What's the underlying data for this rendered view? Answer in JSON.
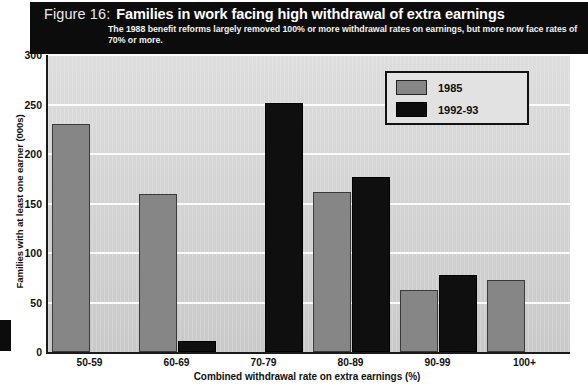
{
  "header": {
    "figure_number": "Figure 16:",
    "title": "Families in work facing high withdrawal of extra earnings",
    "subtitle": "The 1988 benefit reforms largely removed 100% or more withdrawal rates on earnings, but more now face rates of 70% or more."
  },
  "legend": {
    "position": "top-right",
    "items": [
      {
        "label": "1985",
        "color": "#868686"
      },
      {
        "label": "1992-93",
        "color": "#0d0d0d"
      }
    ]
  },
  "axes": {
    "y_ticks": [
      "300",
      "250",
      "200",
      "150",
      "100",
      "50",
      "0"
    ],
    "y_title": "Families with at least one earner (000s)",
    "x_title": "Combined withdrawal rate on extra earnings (%)"
  },
  "chart_data": {
    "type": "bar",
    "title": "Families in work facing high withdrawal of extra earnings",
    "subtitle": "The 1988 benefit reforms largely removed 100% or more withdrawal rates on earnings, but more now face rates of 70% or more.",
    "categories": [
      "50-59",
      "60-69",
      "70-79",
      "80-89",
      "90-99",
      "100+"
    ],
    "series": [
      {
        "name": "1985",
        "color": "#868686",
        "values": [
          230,
          160,
          0,
          162,
          63,
          73
        ]
      },
      {
        "name": "1992-93",
        "color": "#0d0d0d",
        "values": [
          0,
          11,
          252,
          177,
          78,
          0
        ]
      }
    ],
    "xlabel": "Combined withdrawal rate on extra earnings (%)",
    "ylabel": "Families with at least one earner (000s)",
    "ylim": [
      0,
      300
    ],
    "ytick_step": 50,
    "grid": true,
    "legend_position": "top-right"
  }
}
